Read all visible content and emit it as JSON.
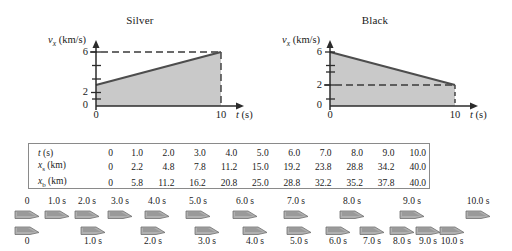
{
  "figure": {
    "graphs": [
      {
        "key": "silver",
        "title": "Silver",
        "ylabel_main": "v",
        "ylabel_sub": "x",
        "ylabel_units": "(km/s)",
        "xlabel_main": "t",
        "xlabel_units": "(s)",
        "y_ticks_labeled": [
          "6",
          "2",
          "0"
        ],
        "x_ticks_labeled": [
          "0",
          "10"
        ],
        "chart_data": {
          "type": "line",
          "title": "Silver",
          "xlabel": "t (s)",
          "ylabel": "v_x (km/s)",
          "xlim": [
            0,
            10
          ],
          "ylim": [
            0,
            7
          ],
          "x": [
            0,
            10
          ],
          "values": [
            2,
            6
          ],
          "fill": "shaded-area-under-curve",
          "guides": [
            "dashed horizontal at v_x = 6",
            "dashed vertical at t = 10"
          ],
          "grid": false
        }
      },
      {
        "key": "black",
        "title": "Black",
        "ylabel_main": "v",
        "ylabel_sub": "x",
        "ylabel_units": "(km/s)",
        "xlabel_main": "t",
        "xlabel_units": "(s)",
        "y_ticks_labeled": [
          "6",
          "2",
          "0"
        ],
        "x_ticks_labeled": [
          "0",
          "10"
        ],
        "chart_data": {
          "type": "line",
          "title": "Black",
          "xlabel": "t (s)",
          "ylabel": "v_x (km/s)",
          "xlim": [
            0,
            10
          ],
          "ylim": [
            0,
            7
          ],
          "x": [
            0,
            10
          ],
          "values": [
            6,
            2
          ],
          "fill": "shaded-area-under-curve",
          "guides": [
            "dashed horizontal at v_x = 2",
            "dashed vertical at t = 10"
          ],
          "grid": false
        }
      }
    ],
    "table": {
      "rows": [
        {
          "label_sym": "t",
          "label_sub": "",
          "label_units": "(s)",
          "values": [
            "0",
            "1.0",
            "2.0",
            "3.0",
            "4.0",
            "5.0",
            "6.0",
            "7.0",
            "8.0",
            "9.0",
            "10.0"
          ]
        },
        {
          "label_sym": "x",
          "label_sub": "s",
          "label_units": "(km)",
          "values": [
            "0",
            "2.2",
            "4.8",
            "7.8",
            "11.2",
            "15.0",
            "19.2",
            "23.8",
            "28.8",
            "34.2",
            "40.0"
          ]
        },
        {
          "label_sym": "x",
          "label_sub": "b",
          "label_units": "(km)",
          "values": [
            "0",
            "5.8",
            "11.2",
            "16.2",
            "20.8",
            "25.0",
            "28.8",
            "32.2",
            "35.2",
            "37.8",
            "40.0"
          ]
        }
      ]
    },
    "motion_diagram": {
      "silver_row": {
        "labels": [
          "0",
          "1.0 s",
          "2.0 s",
          "3.0 s",
          "4.0 s",
          "5.0 s",
          "6.0 s",
          "7.0 s",
          "8.0 s",
          "9.0 s",
          "10.0 s"
        ],
        "positions_px": [
          27,
          57,
          87,
          120,
          157,
          198,
          245,
          296,
          352,
          412,
          478
        ]
      },
      "black_row": {
        "labels": [
          "0",
          "1.0 s",
          "2.0 s",
          "3.0 s",
          "4.0 s",
          "5.0 s",
          "6.0 s",
          "7.0 s",
          "8.0 s",
          "9.0 s",
          "10.0 s"
        ],
        "positions_px": [
          27,
          93,
          153,
          207,
          255,
          299,
          338,
          372,
          402,
          428,
          452
        ]
      }
    },
    "colors": {
      "curve": "#4d4d4d",
      "fill": "#c9c9c9",
      "axis": "#2b2b2b",
      "dashed": "#3a3a3a",
      "table_border": "#8a8a8a",
      "car_body": "#b0b0b0",
      "car_outline": "#6e6e6e"
    }
  }
}
